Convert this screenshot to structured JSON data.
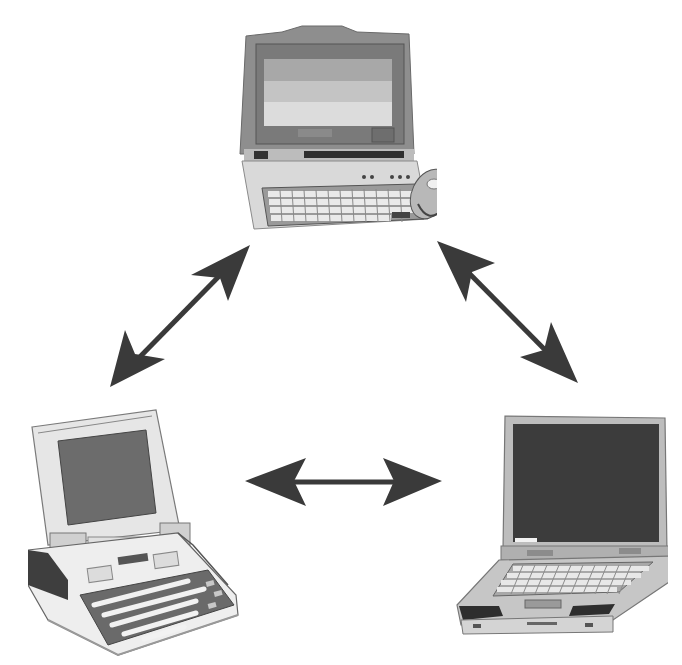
{
  "diagram": {
    "type": "network-triangle",
    "background": "#ffffff",
    "nodes": [
      {
        "id": "laptop-top",
        "label": "",
        "kind": "laptop with attached trackball",
        "x": 232,
        "y": 14,
        "w": 200,
        "h": 222
      },
      {
        "id": "laptop-bottom-left",
        "label": "",
        "kind": "laptop with tilted keyboard",
        "x": 28,
        "y": 405,
        "w": 222,
        "h": 255
      },
      {
        "id": "laptop-bottom-right",
        "label": "",
        "kind": "laptop with dark screen",
        "x": 443,
        "y": 410,
        "w": 222,
        "h": 225
      }
    ],
    "edges": [
      {
        "from": "laptop-top",
        "to": "laptop-bottom-left",
        "direction": "bidirectional",
        "x1": 250,
        "y1": 245,
        "x2": 110,
        "y2": 387
      },
      {
        "from": "laptop-top",
        "to": "laptop-bottom-right",
        "direction": "bidirectional",
        "x1": 437,
        "y1": 241,
        "x2": 578,
        "y2": 383
      },
      {
        "from": "laptop-bottom-left",
        "to": "laptop-bottom-right",
        "direction": "bidirectional",
        "x1": 245,
        "y1": 481,
        "x2": 442,
        "y2": 481
      }
    ],
    "colors": {
      "arrow": "#3a3a3a",
      "laptop_body": "#d8d8d8",
      "laptop_dark": "#5a5a5a",
      "screen_dark": "#3c3c3c",
      "screen_mid": "#8a8a8a"
    }
  }
}
